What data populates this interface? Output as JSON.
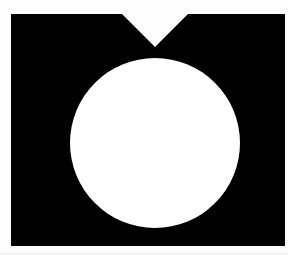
{
  "figure": {
    "title": "Black rectangle with notched top and white circle",
    "canvas": {
      "width": 288,
      "height": 255,
      "background_color": "#fdfdfd"
    },
    "shapes": [
      {
        "name": "notched-rectangle",
        "kind": "polygon",
        "fill_color": "#000000",
        "left": 11,
        "top": 14,
        "right": 285,
        "bottom": 246,
        "width": 274,
        "height": 232,
        "notch": {
          "name": "v-notch",
          "kind": "triangle-cutout",
          "edge": "top",
          "left_x": 122,
          "right_x": 188,
          "apex_x": 155,
          "apex_y": 47,
          "opening_width": 66,
          "depth": 33
        },
        "points": "11,14 122,14 155,47 188,14 285,14 285,246 11,246"
      },
      {
        "name": "inner-circle",
        "kind": "circle",
        "fill_color": "#ffffff",
        "center_x": 155,
        "center_y": 143,
        "radius": 85,
        "diameter": 170,
        "bounds": {
          "left": 70,
          "top": 58,
          "right": 240,
          "bottom": 228
        }
      }
    ],
    "colors": {
      "foreground": "#000000",
      "circle": "#ffffff",
      "background": "#fdfdfd",
      "edge_tint": "#f2f2f2"
    }
  }
}
